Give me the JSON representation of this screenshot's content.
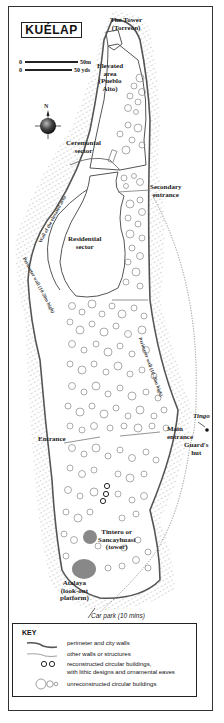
{
  "map": {
    "title": "KUÉLAP",
    "scale": {
      "metric_label": "50m",
      "imperial_label": "50 yds",
      "zero": "0"
    },
    "compass": {
      "north_label": "N"
    },
    "labels": {
      "tower": "The Tower (Torreón)",
      "tower_line1": "The Tower",
      "tower_line2": "(Torreón)",
      "elevated_line1": "Elevated",
      "elevated_line2": "area",
      "elevated_line3": "(Pueblo",
      "elevated_line4": "Alto)",
      "ceremonial_line1": "Ceremonial",
      "ceremonial_line2": "sector",
      "secondary_line1": "Secondary",
      "secondary_line2": "entrance",
      "residential_line1": "Residential",
      "residential_line2": "sector",
      "wall_elevated": "Wall of the elevated area",
      "perimeter_left": "Perimeter wall (10-20m high)",
      "perimeter_right": "Perimeter wall (10-20m high)",
      "entrance": "Entrance",
      "main_line1": "Main",
      "main_line2": "entrance",
      "tingo": "Tingo",
      "guard_line1": "Guard's",
      "guard_line2": "hut",
      "tintero_line1": "Tintero or",
      "tintero_line2": "Sancayhuasi",
      "tintero_line3": "(tower)",
      "atalaya_line1": "Atalaya",
      "atalaya_line2": "(look-out",
      "atalaya_line3": "platform)",
      "car_park": "Car park (10 mins)"
    },
    "colors": {
      "wall": "#555555",
      "fill_feature": "#888888",
      "hatch": "#999999",
      "background": "#ffffff"
    }
  },
  "key": {
    "title": "KEY",
    "items": [
      {
        "symbol": "perimeter-wall-line",
        "label": "perimeter and city walls"
      },
      {
        "symbol": "other-wall-line",
        "label": "other walls or structures"
      },
      {
        "symbol": "reconstructed-circles",
        "label": "reconstructed circular buildings,"
      },
      {
        "symbol": "reconstructed-circles-cont",
        "label": "with lithic designs and ornamental eaves"
      },
      {
        "symbol": "unreconstructed-circles",
        "label": "unreconstructed circular buildings"
      }
    ]
  }
}
